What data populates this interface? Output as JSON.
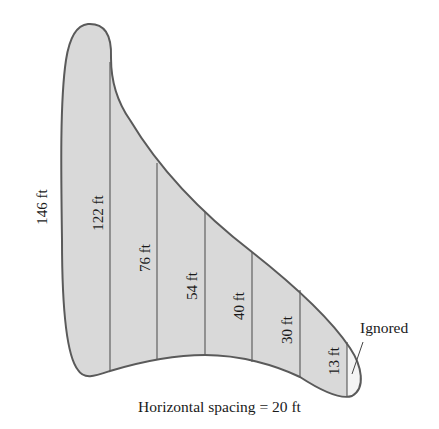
{
  "colors": {
    "fill": "#d9d9d9",
    "outline": "#5a5a5a",
    "divider": "#555555",
    "text": "#1a1a1a",
    "ignored_fill": "#f4f4f4"
  },
  "measurements": [
    {
      "label": "146 ft",
      "value": 146,
      "unit": "ft"
    },
    {
      "label": "122 ft",
      "value": 122,
      "unit": "ft"
    },
    {
      "label": "76 ft",
      "value": 76,
      "unit": "ft"
    },
    {
      "label": "54 ft",
      "value": 54,
      "unit": "ft"
    },
    {
      "label": "40 ft",
      "value": 40,
      "unit": "ft"
    },
    {
      "label": "30 ft",
      "value": 30,
      "unit": "ft"
    },
    {
      "label": "13 ft",
      "value": 13,
      "unit": "ft"
    }
  ],
  "annotation": {
    "ignored_label": "Ignored"
  },
  "caption": {
    "text": "Horizontal spacing = 20 ft"
  }
}
